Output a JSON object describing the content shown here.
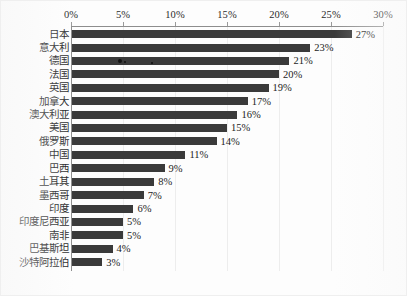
{
  "chart_data": {
    "type": "bar",
    "orientation": "horizontal",
    "title": "",
    "xlabel": "",
    "ylabel": "",
    "xlim": [
      0,
      30
    ],
    "xtick_labels": [
      "0%",
      "5%",
      "10%",
      "15%",
      "20%",
      "25%",
      "30%"
    ],
    "xticks": [
      0,
      5,
      10,
      15,
      20,
      25,
      30
    ],
    "grid": true,
    "legend": false,
    "axis_label_position": "top",
    "value_label_suffix": "%",
    "bar_color": "#3a3a3a",
    "categories": [
      "日本",
      "意大利",
      "德国",
      "法国",
      "英国",
      "加拿大",
      "澳大利亚",
      "美国",
      "俄罗斯",
      "中国",
      "巴西",
      "土耳其",
      "墨西哥",
      "印度",
      "印度尼西亚",
      "南非",
      "巴基斯坦",
      "沙特阿拉伯"
    ],
    "values": [
      27,
      23,
      21,
      20,
      19,
      17,
      16,
      15,
      14,
      11,
      9,
      8,
      7,
      6,
      5,
      5,
      4,
      3
    ],
    "value_labels": [
      "27%",
      "23%",
      "21%",
      "20%",
      "19%",
      "17%",
      "16%",
      "15%",
      "14%",
      "11%",
      "9%",
      "8%",
      "7%",
      "6%",
      "5%",
      "5%",
      "4%",
      "3%"
    ]
  }
}
